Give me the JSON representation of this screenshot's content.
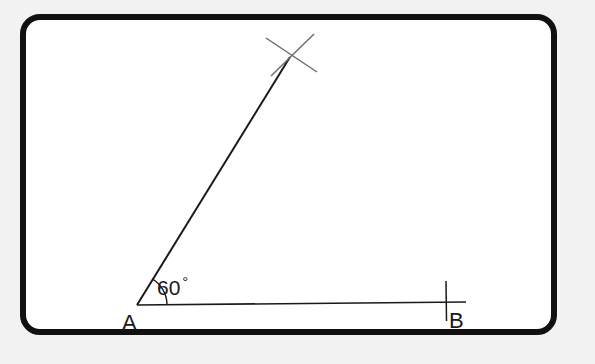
{
  "figure": {
    "background_outside": "#f2f2f2",
    "background_inside": "#ffffff",
    "frame": {
      "border_color": "#111111",
      "border_width_px": 6,
      "corner_radius_px": 20
    },
    "labels": {
      "vertex_a": "A",
      "vertex_b": "B",
      "angle": "60",
      "degree_symbol": "°"
    },
    "geometry": {
      "stroke_color": "#1a1a1a",
      "stroke_color_light": "#707070",
      "point_a": [
        137,
        305
      ],
      "point_b": [
        446,
        302
      ],
      "ray_end": [
        290,
        57
      ],
      "baseline_end": [
        466,
        302
      ],
      "angle_degrees": 60,
      "arc_radius_px": 30,
      "tick_at_b": {
        "x": 446,
        "y_top": 281,
        "y_bottom": 321
      },
      "cross_mark": {
        "center": [
          291,
          55
        ],
        "stroke_1": [
          [
            266,
            38
          ],
          [
            317,
            72
          ]
        ],
        "stroke_2": [
          [
            271,
            76
          ],
          [
            314,
            34
          ]
        ]
      }
    }
  }
}
